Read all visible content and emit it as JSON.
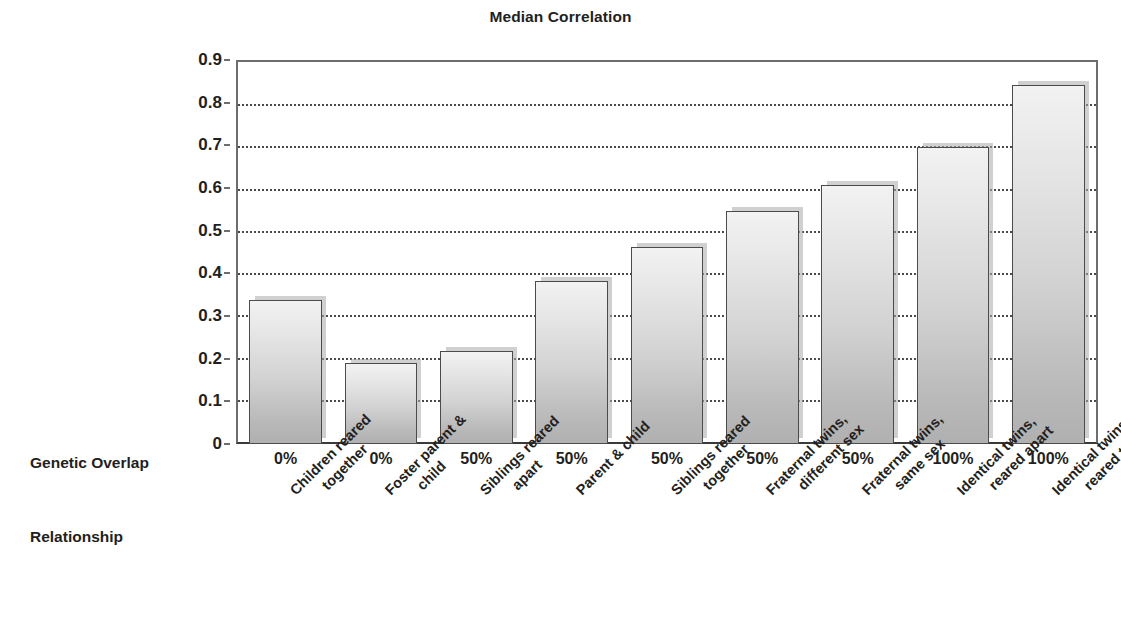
{
  "chart_data": {
    "type": "bar",
    "title": "Median Correlation",
    "xlabel": "",
    "ylabel": "",
    "ylim": [
      0,
      0.9
    ],
    "grid": true,
    "legend": false,
    "categories": [
      "Children reared together",
      "Foster parent & child",
      "Siblings reared apart",
      "Parent & child",
      "Siblings reared together",
      "Fraternal twins, different sex",
      "Fraternal twins, same sex",
      "Identical twins, reared apart",
      "Identical twins, reared together"
    ],
    "values": [
      0.34,
      0.19,
      0.22,
      0.385,
      0.465,
      0.548,
      0.61,
      0.7,
      0.845
    ],
    "ytick_labels": [
      "0.9",
      "0.8",
      "0.7",
      "0.6",
      "0.5",
      "0.4",
      "0.3",
      "0.2",
      "0.1",
      "0"
    ],
    "ytick_values": [
      0.9,
      0.8,
      0.7,
      0.6,
      0.5,
      0.4,
      0.3,
      0.2,
      0.1,
      0
    ],
    "bar_color": "#d2d2d2",
    "bar_border_color": "#4b4b4b",
    "gridline_color": "#4a4a4a",
    "axis_color": "#6d6d6d",
    "text_color": "#231f20"
  },
  "row_labels": {
    "genetic_overlap": "Genetic Overlap",
    "relationship": "Relationship"
  },
  "genetic_overlap_values": [
    "0%",
    "0%",
    "50%",
    "50%",
    "50%",
    "50%",
    "50%",
    "100%",
    "100%"
  ],
  "relationship_labels": [
    {
      "line1": "Children reared",
      "line2": "together"
    },
    {
      "line1": "Foster parent &",
      "line2": "child"
    },
    {
      "line1": "Siblings reared",
      "line2": "apart"
    },
    {
      "line1": "Parent & child",
      "line2": ""
    },
    {
      "line1": "Siblings reared",
      "line2": "together"
    },
    {
      "line1": "Fraternal twins,",
      "line2": "different sex"
    },
    {
      "line1": "Fraternal twins,",
      "line2": "same sex"
    },
    {
      "line1": "Identical twins,",
      "line2": "reared apart"
    },
    {
      "line1": "Identical twins,",
      "line2": "reared together"
    }
  ]
}
